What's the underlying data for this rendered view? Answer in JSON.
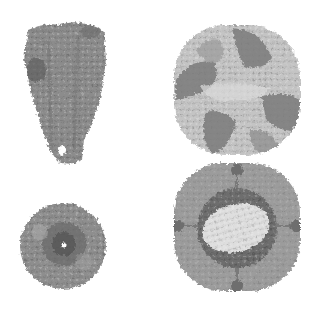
{
  "figure": {
    "panels": [
      {
        "id": "stalk-side",
        "label": "elongated protein complex, side view"
      },
      {
        "id": "ring-top",
        "label": "same complex, top view with central pore"
      },
      {
        "id": "sphere-outer",
        "label": "spherical protein cage, exterior view"
      },
      {
        "id": "sphere-cutaway",
        "label": "spherical protein cage, cutaway view"
      }
    ],
    "colors": {
      "background": "#ffffff",
      "light": "#c8c8c8",
      "mid": "#9a9a9a",
      "dark": "#6e6e6e",
      "darker": "#585858",
      "pale": "#e2e2e2"
    }
  }
}
